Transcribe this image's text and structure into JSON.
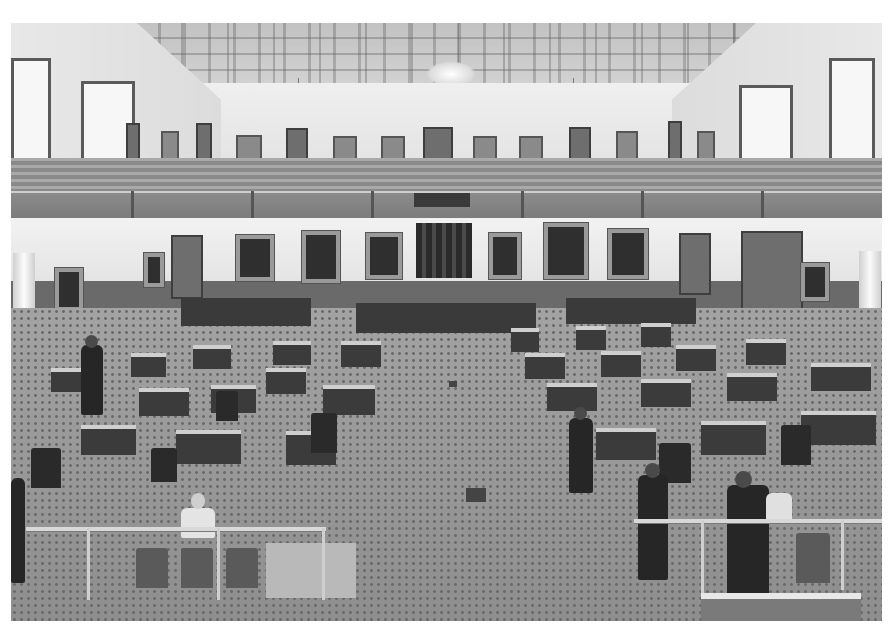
{
  "image": {
    "description": "Black-and-white photograph of an ornate legislative chamber (senate floor) viewed from the upper gallery",
    "subject": "legislative chamber interior",
    "color_mode": "grayscale",
    "frame": {
      "left": 11,
      "top": 23,
      "width": 871,
      "height": 598,
      "border_color": "#ffffff"
    },
    "palette": {
      "ceiling": "#e6e6e6",
      "walls": "#efefef",
      "wood_dado": "#6a6a6a",
      "portraits": "#2f2f2f",
      "carpet": "#9a9a9a",
      "desks": "#3b3b3b"
    },
    "elements": {
      "ceiling": "coffered ornamental ceiling with central chandelier",
      "chandeliers": 3,
      "gallery": "tiered public gallery with railing around upper level",
      "portraits": "framed portraits along lower walls",
      "dais": "presiding officer's rostrum with draped canopy at far center",
      "floor": "patterned carpet with rows of wooden desks and chairs",
      "foreground": "brass rail barrier with people standing and seated"
    }
  }
}
